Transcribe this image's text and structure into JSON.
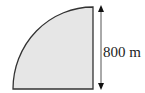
{
  "diagram": {
    "shape": "quarter-circle",
    "fill_color": "#e6e6e6",
    "stroke_color": "#333333",
    "dimension_label": "800 m",
    "dimension_arrow": "double-headed vertical arrow"
  }
}
